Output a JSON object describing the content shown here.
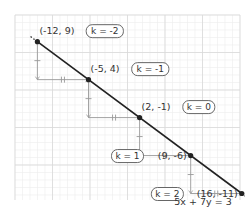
{
  "diagram": {
    "type": "lattice-points-on-line",
    "equation_label": "5x + 7y = 3",
    "line": {
      "a": 5,
      "b": 7,
      "c": 3
    },
    "grid": {
      "x_range": [
        -13,
        17
      ],
      "y_range": [
        -13,
        11
      ]
    },
    "step": {
      "dx": 7,
      "dy": -5
    },
    "colors": {
      "line": "#222222",
      "grid": "#d9d9d9",
      "grid_minor": "#ececec",
      "helper": "#999999",
      "point": "#222222",
      "text": "#333333"
    },
    "points": [
      {
        "x": -12,
        "y": 9,
        "coord_label": "(-12, 9)",
        "k_label": "k = -2"
      },
      {
        "x": -5,
        "y": 4,
        "coord_label": "(-5, 4)",
        "k_label": "k = -1"
      },
      {
        "x": 2,
        "y": -1,
        "coord_label": "(2, -1)",
        "k_label": "k = 0"
      },
      {
        "x": 9,
        "y": -6,
        "coord_label": "(9, -6)",
        "k_label": "k = 1"
      },
      {
        "x": 16,
        "y": -11,
        "coord_label": "(16, -11)",
        "k_label": "k = 2"
      }
    ]
  }
}
